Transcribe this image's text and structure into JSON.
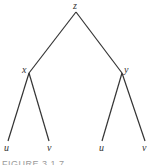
{
  "diagram": {
    "type": "binary-tree",
    "nodes": [
      {
        "id": "z",
        "label": "z",
        "x": 76,
        "y": 12
      },
      {
        "id": "x",
        "label": "x",
        "x": 29,
        "y": 73
      },
      {
        "id": "y",
        "label": "y",
        "x": 122,
        "y": 73
      },
      {
        "id": "u1",
        "label": "u",
        "x": 8,
        "y": 141
      },
      {
        "id": "v1",
        "label": "v",
        "x": 49,
        "y": 141
      },
      {
        "id": "u2",
        "label": "u",
        "x": 102,
        "y": 141
      },
      {
        "id": "v2",
        "label": "v",
        "x": 145,
        "y": 141
      }
    ],
    "edges": [
      [
        "z",
        "x"
      ],
      [
        "z",
        "y"
      ],
      [
        "x",
        "u1"
      ],
      [
        "x",
        "v1"
      ],
      [
        "y",
        "u2"
      ],
      [
        "y",
        "v2"
      ]
    ],
    "caption": "FIGURE 3.1.7"
  },
  "colors": {
    "edge": "#333333",
    "label": "#333333",
    "caption": "#9a9a9a"
  }
}
